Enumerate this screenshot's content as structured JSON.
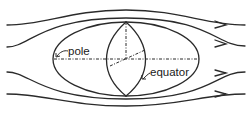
{
  "diagram": {
    "labels": {
      "pole": "pole",
      "equator": "equator"
    },
    "streamline_count": 4,
    "colors": {
      "line": "#2a2a2a",
      "background": "#ffffff"
    }
  }
}
